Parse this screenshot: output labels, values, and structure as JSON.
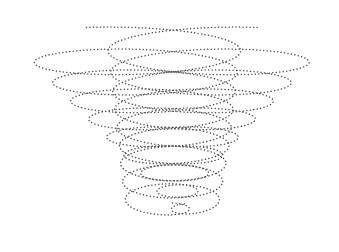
{
  "image": {
    "description": "Dotted line drawing of two intersecting conical helices",
    "background": "#ffffff",
    "stroke_color": "#555555",
    "dot_spacing": 3.4,
    "dot_size": 1.5
  },
  "helices": [
    {
      "name": "left-helix",
      "turns": [
        {
          "cx": 130,
          "cy": 44,
          "rx": 112,
          "ry": 18
        },
        {
          "cx": 138,
          "cy": 66,
          "rx": 100,
          "ry": 18
        },
        {
          "cx": 146,
          "cy": 86,
          "rx": 90,
          "ry": 17
        },
        {
          "cx": 154,
          "cy": 104,
          "rx": 80,
          "ry": 16
        },
        {
          "cx": 162,
          "cy": 122,
          "rx": 70,
          "ry": 15
        },
        {
          "cx": 170,
          "cy": 140,
          "rx": 60,
          "ry": 14
        },
        {
          "cx": 177,
          "cy": 158,
          "rx": 50,
          "ry": 13
        },
        {
          "cx": 184,
          "cy": 176,
          "rx": 40,
          "ry": 12
        },
        {
          "cx": 190,
          "cy": 194,
          "rx": 30,
          "ry": 10
        },
        {
          "cx": 196,
          "cy": 212,
          "rx": 22,
          "ry": 9
        }
      ]
    },
    {
      "name": "right-helix",
      "turns": [
        {
          "cx": 215,
          "cy": 44,
          "rx": 108,
          "ry": 18
        },
        {
          "cx": 208,
          "cy": 66,
          "rx": 98,
          "ry": 18
        },
        {
          "cx": 200,
          "cy": 86,
          "rx": 88,
          "ry": 17
        },
        {
          "cx": 192,
          "cy": 104,
          "rx": 78,
          "ry": 16
        },
        {
          "cx": 184,
          "cy": 122,
          "rx": 68,
          "ry": 15
        },
        {
          "cx": 177,
          "cy": 140,
          "rx": 58,
          "ry": 14
        },
        {
          "cx": 170,
          "cy": 158,
          "rx": 50,
          "ry": 13
        },
        {
          "cx": 164,
          "cy": 176,
          "rx": 42,
          "ry": 12
        },
        {
          "cx": 160,
          "cy": 194,
          "rx": 36,
          "ry": 11
        },
        {
          "cx": 158,
          "cy": 212,
          "rx": 30,
          "ry": 10
        }
      ]
    }
  ]
}
